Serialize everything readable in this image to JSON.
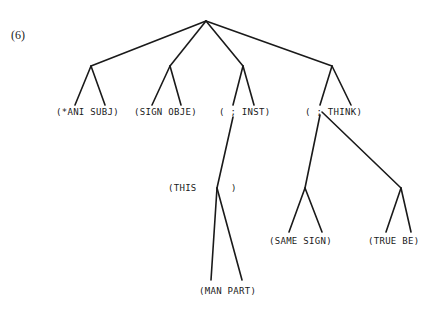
{
  "figure": {
    "number_label": "(6)"
  },
  "tree": {
    "root": {
      "x": 206,
      "y": 21
    },
    "nodes": [
      {
        "id": "n1",
        "x": 91,
        "y": 66
      },
      {
        "id": "n2",
        "x": 170,
        "y": 66
      },
      {
        "id": "n3",
        "x": 243,
        "y": 66
      },
      {
        "id": "n4",
        "x": 332,
        "y": 66
      },
      {
        "id": "n3a",
        "x": 217,
        "y": 188
      },
      {
        "id": "n4a",
        "x": 305,
        "y": 188
      },
      {
        "id": "n4b",
        "x": 401,
        "y": 188
      }
    ],
    "labels": {
      "ani_subj": "(*ANI SUBJ)",
      "sign_obje": "(SIGN OBJE)",
      "inst": "( ; INST)",
      "think": "( ; THINK)",
      "this": "(THIS      )",
      "same_sign": "(SAME SIGN)",
      "true_be": "(TRUE BE)",
      "man_part": "(MAN PART)"
    }
  }
}
